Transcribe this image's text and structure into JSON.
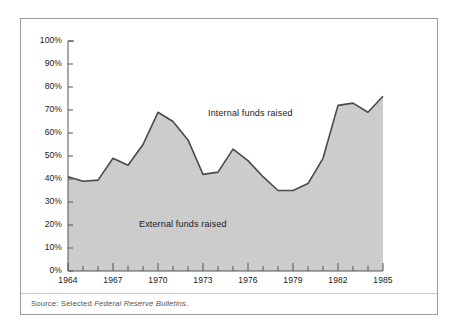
{
  "figure": {
    "source_prefix": "Source: Selected ",
    "source_italic": "Federal Reserve Bulletins",
    "source_suffix": ".",
    "frame_color": "#9a9a9a",
    "area_fill_color": "#cccccc",
    "line_color": "#4a4a4a",
    "background_color": "#ffffff"
  },
  "chart_data": {
    "type": "area",
    "title": "",
    "subtitle": "",
    "xlabel": "",
    "ylabel": "",
    "x": [
      1964,
      1965,
      1966,
      1967,
      1968,
      1969,
      1970,
      1971,
      1972,
      1973,
      1974,
      1975,
      1976,
      1977,
      1978,
      1979,
      1980,
      1981,
      1982,
      1983,
      1984,
      1985
    ],
    "values": [
      41,
      39,
      39.5,
      49,
      46,
      55,
      69,
      65,
      57,
      42,
      43,
      53,
      48,
      41,
      35,
      35,
      38,
      49,
      72,
      73,
      69,
      76
    ],
    "series": [
      {
        "name": "External funds raised",
        "values": [
          41,
          39,
          39.5,
          49,
          46,
          55,
          69,
          65,
          57,
          42,
          43,
          53,
          48,
          41,
          35,
          35,
          38,
          49,
          72,
          73,
          69,
          76
        ],
        "region": "below-curve",
        "fill": "#cccccc"
      },
      {
        "name": "Internal funds raised",
        "region": "above-curve",
        "fill": "#ffffff"
      }
    ],
    "annotations": [
      {
        "text": "Internal funds raised",
        "x": 1975,
        "y": 86
      },
      {
        "text": "External funds raised",
        "x": 1969,
        "y": 38
      }
    ],
    "ylim": [
      0,
      100
    ],
    "ytick_values": [
      0,
      10,
      20,
      30,
      40,
      50,
      60,
      70,
      80,
      90,
      100
    ],
    "ytick_labels": [
      "0%",
      "10%",
      "20%",
      "30%",
      "40%",
      "50%",
      "60%",
      "70%",
      "80%",
      "90%",
      "100%"
    ],
    "xlim": [
      1964,
      1985
    ],
    "xtick_values": [
      1964,
      1967,
      1970,
      1973,
      1976,
      1979,
      1982,
      1985
    ],
    "xtick_labels": [
      "1964",
      "1967",
      "1970",
      "1973",
      "1976",
      "1979",
      "1982",
      "1985"
    ],
    "xminor_tick_values": [
      1965,
      1966,
      1968,
      1969,
      1971,
      1972,
      1974,
      1975,
      1977,
      1978,
      1980,
      1981,
      1983,
      1984
    ],
    "grid": false,
    "legend_position": "inline-annotations"
  }
}
